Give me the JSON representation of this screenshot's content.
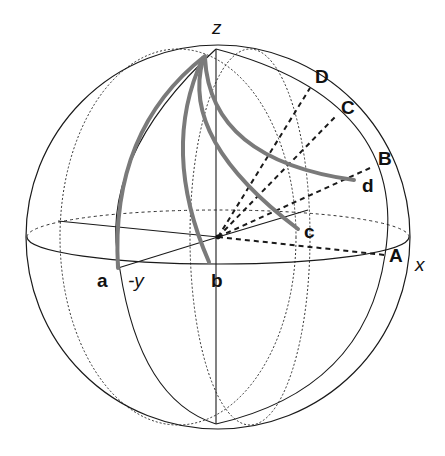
{
  "figure": {
    "type": "sphere-diagram",
    "axes": {
      "z": "z",
      "x": "x",
      "neg_y": "-y"
    },
    "great_circle_points": {
      "A": "A",
      "B": "B",
      "C": "C",
      "D": "D"
    },
    "curve_endpoints": {
      "a": "a",
      "b": "b",
      "c": "c",
      "d": "d"
    },
    "colors": {
      "line": "#1a1a1a",
      "curve": "#7a7a7a",
      "background": "#ffffff"
    }
  }
}
